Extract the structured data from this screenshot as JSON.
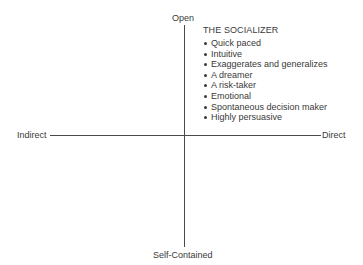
{
  "axes": {
    "top": "Open",
    "bottom": "Self-Contained",
    "left": "Indirect",
    "right": "Direct"
  },
  "quadrant": {
    "position": "top-right",
    "title": "THE SOCIALIZER",
    "traits": [
      "Quick paced",
      "Intuitive",
      "Exaggerates and generalizes",
      "A dreamer",
      "A risk-taker",
      "Emotional",
      "Spontaneous decision maker",
      "Highly persuasive"
    ]
  },
  "colors": {
    "line": "#4a4a4a",
    "text": "#3a3a3a",
    "background": "#ffffff"
  }
}
